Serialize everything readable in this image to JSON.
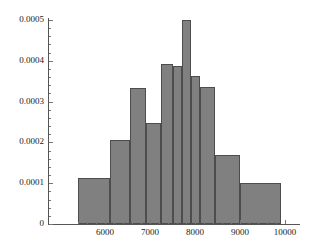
{
  "chart_data": {
    "type": "bar",
    "title": "",
    "xlabel": "",
    "ylabel": "",
    "grid": false,
    "legend": null,
    "xlim": [
      5200,
      10100
    ],
    "ylim": [
      0,
      0.0005
    ],
    "xticks": [
      "6000",
      "7000",
      "8000",
      "9000",
      "10000"
    ],
    "xtick_values": [
      6000,
      7000,
      8000,
      9000,
      10000
    ],
    "yticks": [
      "0",
      "0.0001",
      "0.0002",
      "0.0003",
      "0.0004",
      "0.0005"
    ],
    "ytick_values": [
      0,
      0.0001,
      0.0002,
      0.0003,
      0.0004,
      0.0005
    ],
    "bin_edges": [
      5400,
      5700,
      6000,
      6300,
      6600,
      6900,
      7200,
      7500,
      7800,
      8100,
      8400,
      8700,
      9000,
      9300,
      9600,
      9900
    ],
    "bins": [
      {
        "x0": 5400,
        "x1": 6100,
        "value": 0.000112
      },
      {
        "x0": 6100,
        "x1": 6550,
        "value": 0.000205
      },
      {
        "x0": 6550,
        "x1": 6900,
        "value": 0.000333
      },
      {
        "x0": 6900,
        "x1": 7250,
        "value": 0.000247
      },
      {
        "x0": 7250,
        "x1": 7500,
        "value": 0.000393
      },
      {
        "x0": 7500,
        "x1": 7700,
        "value": 0.000388
      },
      {
        "x0": 7700,
        "x1": 7900,
        "value": 0.0005
      },
      {
        "x0": 7900,
        "x1": 8100,
        "value": 0.000362
      },
      {
        "x0": 8100,
        "x1": 8450,
        "value": 0.000335
      },
      {
        "x0": 8450,
        "x1": 9000,
        "value": 0.000168
      },
      {
        "x0": 9000,
        "x1": 9900,
        "value": 0.000101
      }
    ],
    "categories": [
      "5400-6100",
      "6100-6550",
      "6550-6900",
      "6900-7250",
      "7250-7500",
      "7500-7700",
      "7700-7900",
      "7900-8100",
      "8100-8450",
      "8450-9000",
      "9000-9900"
    ],
    "values": [
      0.000112,
      0.000205,
      0.000333,
      0.000247,
      0.000393,
      0.000388,
      0.0005,
      0.000362,
      0.000335,
      0.000168,
      0.000101
    ],
    "bar_color": "#808080",
    "bar_edge_color": "#4d4d4d",
    "axis_color": "#555555"
  }
}
